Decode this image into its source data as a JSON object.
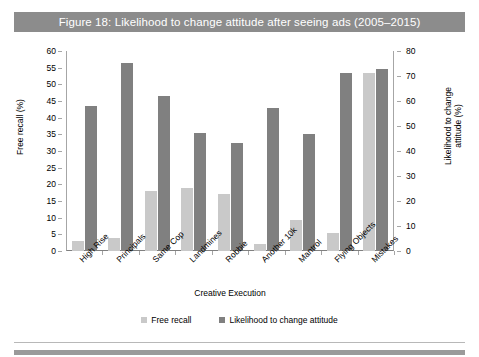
{
  "figure": {
    "title": "Figure 18: Likelihood to change attitude after seeing ads (2005–2015)",
    "title_bar_color": "#8c8c8c",
    "title_text_color": "#ffffff"
  },
  "legend": {
    "position": "bottom-center",
    "items": [
      {
        "label": "Free recall",
        "color": "#c9c9c9"
      },
      {
        "label": "Likelihood to change attitude",
        "color": "#808080"
      }
    ]
  },
  "chart_data": {
    "type": "bar",
    "title": "Figure 18: Likelihood to change attitude after seeing ads (2005–2015)",
    "xlabel": "Creative Execution",
    "ylabel": "Free recall (%)",
    "y2label": "Likelihood to change attitude (%)",
    "ylim": [
      0,
      60
    ],
    "y2lim": [
      0,
      80
    ],
    "yticks": [
      0,
      5,
      10,
      15,
      20,
      25,
      30,
      35,
      40,
      45,
      50,
      55,
      60
    ],
    "y2ticks": [
      0,
      10,
      20,
      30,
      40,
      50,
      60,
      70,
      80
    ],
    "grid": false,
    "categories": [
      "High Rise",
      "Principals",
      "Same Cop",
      "Landmines",
      "Robbie",
      "Another 10k",
      "Mantrol",
      "Flying Objects",
      "Mistakes"
    ],
    "series": [
      {
        "name": "Free recall",
        "axis": "left",
        "color": "#c9c9c9",
        "values": [
          3,
          4,
          18,
          19,
          17,
          2.2,
          9.3,
          5.3,
          53.5
        ]
      },
      {
        "name": "Likelihood to change attitude",
        "axis": "left",
        "color": "#808080",
        "values": [
          43.5,
          56.5,
          46.5,
          35.5,
          32.5,
          43,
          35,
          53.5,
          54.5
        ]
      }
    ]
  }
}
